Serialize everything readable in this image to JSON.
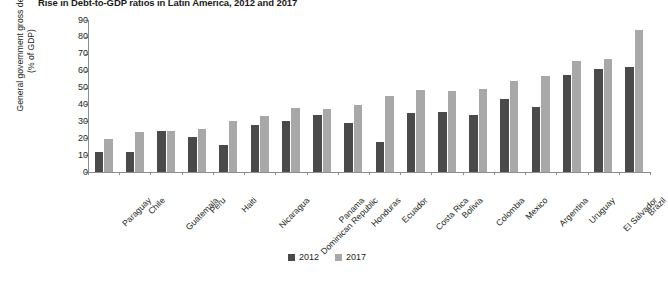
{
  "chart_data": {
    "type": "bar",
    "title": "Rise in Debt-to-GDP ratios in Latin America, 2012 and 2017",
    "xlabel": "",
    "ylabel": "General government gross debt (% of GDP)",
    "ylabel_line1": "General government gross debt",
    "ylabel_line2": "(% of GDP)",
    "ylim": [
      0,
      90
    ],
    "yticks": [
      90,
      80,
      70,
      60,
      50,
      40,
      30,
      20,
      10,
      0
    ],
    "grid": false,
    "legend_position": "bottom-center",
    "categories": [
      "Paraguay",
      "Chile",
      "Guatemala",
      "Peru",
      "Haiti",
      "Nicaragua",
      "Dominican Republic",
      "Panama",
      "Honduras",
      "Ecuador",
      "Costa Rica",
      "Bolivia",
      "Colombia",
      "Mexico",
      "Argentina",
      "Uruguay",
      "El Salvador",
      "Brazil"
    ],
    "series": [
      {
        "name": "2012",
        "color": "#4a4a4a",
        "values": [
          12,
          12,
          24.5,
          21,
          16,
          28,
          30,
          34,
          29,
          18,
          35,
          35.5,
          33.5,
          43,
          38.5,
          57.5,
          61,
          62
        ]
      },
      {
        "name": "2017",
        "color": "#a8a8a8",
        "values": [
          19.5,
          23.5,
          24.5,
          25.5,
          30.5,
          33,
          38,
          37.5,
          39.5,
          45,
          48.5,
          48,
          49,
          54,
          57,
          65.5,
          67,
          84
        ]
      }
    ]
  },
  "legend": {
    "items": [
      {
        "label": "2012",
        "color": "#4a4a4a"
      },
      {
        "label": "2017",
        "color": "#a8a8a8"
      }
    ]
  }
}
